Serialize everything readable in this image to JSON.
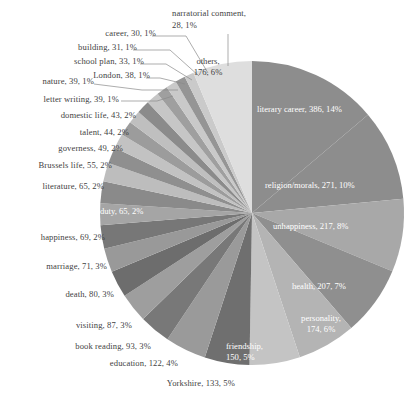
{
  "chart_data": {
    "type": "pie",
    "title": "",
    "subtitle": "",
    "xlabel": "",
    "ylabel": "",
    "legend_position": "none",
    "grid": false,
    "label_format": "name, value, percent",
    "total": 2757,
    "categories": [
      "literary career",
      "religion/morals",
      "unhappiness",
      "health",
      "personality",
      "friendship",
      "Yorkshire",
      "education",
      "book reading",
      "visiting",
      "death",
      "marriage",
      "happiness",
      "duty",
      "literature",
      "Brussels life",
      "governess",
      "talent",
      "domestic life",
      "letter writing",
      "nature",
      "London",
      "school plan",
      "building",
      "career",
      "narratorial comment",
      "others"
    ],
    "values": [
      386,
      271,
      217,
      207,
      174,
      150,
      133,
      122,
      93,
      87,
      80,
      71,
      69,
      65,
      65,
      55,
      49,
      44,
      43,
      39,
      39,
      38,
      33,
      31,
      30,
      28,
      176
    ],
    "percents": [
      "14%",
      "10%",
      "8%",
      "7%",
      "6%",
      "5%",
      "5%",
      "4%",
      "3%",
      "3%",
      "3%",
      "3%",
      "2%",
      "2%",
      "2%",
      "2%",
      "2%",
      "2%",
      "2%",
      "1%",
      "1%",
      "1%",
      "1%",
      "1%",
      "1%",
      "1%",
      "6%"
    ],
    "colors": [
      "#8d8d8d",
      "#8d8d8d",
      "#a8a8a8",
      "#8f8f8f",
      "#b4b4b4",
      "#c4c4c4",
      "#6f6f6f",
      "#9a9a9a",
      "#787878",
      "#9e9e9e",
      "#6d6d6d",
      "#999999",
      "#777777",
      "#a5a5a5",
      "#8a8a8a",
      "#bdbdbd",
      "#8f8f8f",
      "#c2c2c2",
      "#9c9c9c",
      "#bfbfbf",
      "#8b8b8b",
      "#c6c6c6",
      "#9f9f9f",
      "#c9c9c9",
      "#959595",
      "#cacaca",
      "#dedede"
    ],
    "slice_labels": [
      {
        "text": "literary career, 386, 14%",
        "placement": "inside"
      },
      {
        "text": "religion/morals, 271, 10%",
        "placement": "inside"
      },
      {
        "text": "unhappiness, 217, 8%",
        "placement": "inside"
      },
      {
        "text": "health, 207, 7%",
        "placement": "inside"
      },
      {
        "text": "personality,\n174, 6%",
        "placement": "inside"
      },
      {
        "text": "friendship,\n150, 5%",
        "placement": "inside"
      },
      {
        "text": "Yorkshire, 133, 5%",
        "placement": "outside"
      },
      {
        "text": "education, 122, 4%",
        "placement": "outside"
      },
      {
        "text": "book reading, 93, 3%",
        "placement": "outside"
      },
      {
        "text": "visiting, 87, 3%",
        "placement": "outside"
      },
      {
        "text": "death, 80, 3%",
        "placement": "outside"
      },
      {
        "text": "marriage, 71, 3%",
        "placement": "outside"
      },
      {
        "text": "happiness, 69, 2%",
        "placement": "outside"
      },
      {
        "text": "duty, 65, 2%",
        "placement": "inside"
      },
      {
        "text": "literature, 65, 2%",
        "placement": "outside"
      },
      {
        "text": "Brussels life, 55, 2%",
        "placement": "outside"
      },
      {
        "text": "governess, 49, 2%",
        "placement": "outside"
      },
      {
        "text": "talent, 44, 2%",
        "placement": "outside"
      },
      {
        "text": "domestic life, 43, 2%",
        "placement": "outside"
      },
      {
        "text": "letter writing, 39, 1%",
        "placement": "outside"
      },
      {
        "text": "nature, 39, 1%",
        "placement": "outside"
      },
      {
        "text": "London, 38, 1%",
        "placement": "outside"
      },
      {
        "text": "school plan, 33, 1%",
        "placement": "outside"
      },
      {
        "text": "building, 31, 1%",
        "placement": "outside"
      },
      {
        "text": "career, 30, 1%",
        "placement": "outside"
      },
      {
        "text": "narratorial comment,\n28, 1%",
        "placement": "outside"
      },
      {
        "text": "others,\n176, 6%",
        "placement": "inside"
      }
    ]
  },
  "labels": {
    "literary_career": "literary career, 386, 14%",
    "religion_morals": "religion/morals, 271, 10%",
    "unhappiness": "unhappiness, 217, 8%",
    "health": "health, 207, 7%",
    "personality_l1": "personality,",
    "personality_l2": "174, 6%",
    "friendship_l1": "friendship,",
    "friendship_l2": "150, 5%",
    "yorkshire": "Yorkshire, 133, 5%",
    "education": "education, 122, 4%",
    "book_reading": "book reading, 93, 3%",
    "visiting": "visiting, 87, 3%",
    "death": "death, 80, 3%",
    "marriage": "marriage, 71, 3%",
    "happiness": "happiness, 69, 2%",
    "duty": "duty, 65, 2%",
    "literature": "literature, 65, 2%",
    "brussels_life": "Brussels life, 55, 2%",
    "governess": "governess, 49, 2%",
    "talent": "talent, 44, 2%",
    "domestic_life": "domestic life, 43, 2%",
    "letter_writing": "letter writing, 39, 1%",
    "nature": "nature, 39, 1%",
    "london": "London, 38, 1%",
    "school_plan": "school plan, 33, 1%",
    "building": "building, 31, 1%",
    "career": "career, 30, 1%",
    "narratorial_l1": "narratorial comment,",
    "narratorial_l2": "28, 1%",
    "others_l1": "others,",
    "others_l2": "176, 6%"
  }
}
